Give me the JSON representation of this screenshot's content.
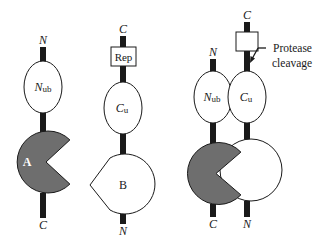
{
  "colors": {
    "shaded_domain": "#6e6e6e",
    "line": "#1a1a1a",
    "background": "#ffffff"
  },
  "constructs": [
    {
      "name": "construct-a",
      "top_terminus": "N",
      "bottom_terminus": "C",
      "ubiquitin_half": {
        "label_main": "N",
        "label_sub": "ub"
      },
      "partner": {
        "label": "A",
        "shape": "pacman",
        "shaded": true
      }
    },
    {
      "name": "construct-b",
      "top_terminus": "C",
      "bottom_terminus": "N",
      "reporter": {
        "label": "Rep"
      },
      "ubiquitin_half": {
        "label_main": "C",
        "label_sub": "u"
      },
      "partner": {
        "label": "B",
        "shape": "teardrop",
        "shaded": false
      }
    },
    {
      "name": "complex",
      "left_top_terminus": "N",
      "right_top_terminus": "C",
      "left_bottom_terminus": "C",
      "right_bottom_terminus": "N",
      "left_half": {
        "label_main": "N",
        "label_sub": "ub"
      },
      "right_half": {
        "label_main": "C",
        "label_sub": "u"
      },
      "annotation": {
        "line1": "Protease",
        "line2": "cleavage"
      }
    }
  ]
}
